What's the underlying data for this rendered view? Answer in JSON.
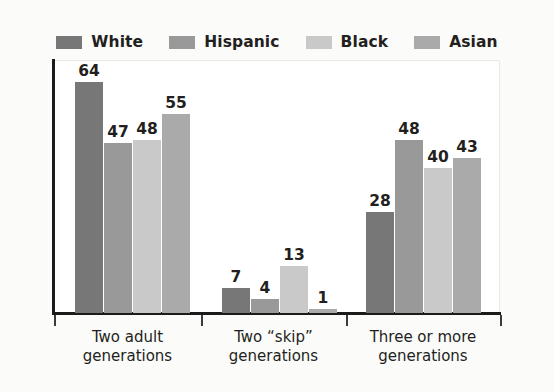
{
  "chart_data": {
    "type": "bar",
    "title": "",
    "subtitle": "",
    "xlabel": "",
    "ylabel": "",
    "ylim": [
      0,
      70
    ],
    "grid": false,
    "legend_position": "top",
    "categories": [
      "Two adult generations",
      "Two “skip” generations",
      "Three or more generations"
    ],
    "category_lines": [
      [
        "Two adult",
        "generations"
      ],
      [
        "Two “skip”",
        "generations"
      ],
      [
        "Three or more",
        "generations"
      ]
    ],
    "series": [
      {
        "name": "White",
        "color": "#777777",
        "values": [
          64,
          7,
          28
        ]
      },
      {
        "name": "Hispanic",
        "color": "#999999",
        "values": [
          47,
          4,
          48
        ]
      },
      {
        "name": "Black",
        "color": "#c9c9c9",
        "values": [
          48,
          13,
          40
        ]
      },
      {
        "name": "Asian",
        "color": "#aaaaaa",
        "values": [
          55,
          1,
          43
        ]
      }
    ]
  },
  "legend": {
    "entries": [
      {
        "label": "White",
        "swatch": "legend-swatch-white"
      },
      {
        "label": "Hispanic",
        "swatch": "legend-swatch-hispanic"
      },
      {
        "label": "Black",
        "swatch": "legend-swatch-black"
      },
      {
        "label": "Asian",
        "swatch": "legend-swatch-asian"
      }
    ]
  },
  "colors": {
    "background": "#fbfbfa",
    "plot_background": "#ffffff",
    "axis": "#1b1b1b",
    "text": "#231f20",
    "series_white": "#777777",
    "series_hispanic": "#999999",
    "series_black": "#c9c9c9",
    "series_asian": "#aaaaaa"
  }
}
